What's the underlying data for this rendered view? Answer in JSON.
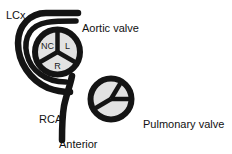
{
  "figure": {
    "background_color": "#ffffff",
    "ink_color": "#141414",
    "cusp_fill_color": "#e2e2e2"
  },
  "labels": {
    "lcx": "LCx",
    "aortic_valve": "Aortic valve",
    "rca": "RCA",
    "pulmonary_valve": "Pulmonary valve",
    "anterior": "Anterior"
  },
  "aortic_valve": {
    "cusps": [
      {
        "id": "non-coronary",
        "label": "NC"
      },
      {
        "id": "left",
        "label": "L"
      },
      {
        "id": "right",
        "label": "R"
      }
    ]
  },
  "pulmonary_valve": {
    "cusps": [
      {
        "id": "anterior",
        "label": ""
      },
      {
        "id": "right",
        "label": ""
      },
      {
        "id": "left",
        "label": ""
      }
    ]
  },
  "vessels": [
    {
      "id": "lcx",
      "label": "LCx"
    },
    {
      "id": "rca",
      "label": "RCA"
    }
  ]
}
